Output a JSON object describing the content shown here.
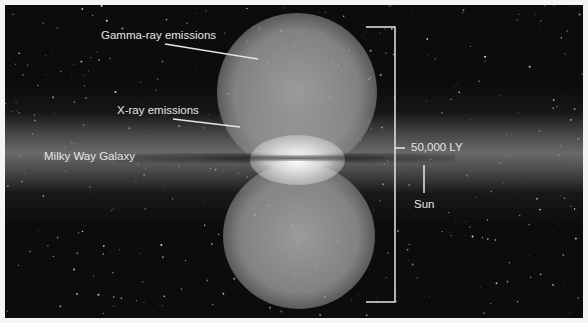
{
  "figure": {
    "labels": {
      "gamma_ray": "Gamma-ray emissions",
      "x_ray": "X-ray emissions",
      "galaxy": "Milky Way Galaxy",
      "scale": "50,000 LY",
      "sun": "Sun"
    },
    "colors": {
      "background": "#0c0c0c",
      "frame_border": "#f4f4f4",
      "annotation": "#e6e6e6"
    }
  }
}
